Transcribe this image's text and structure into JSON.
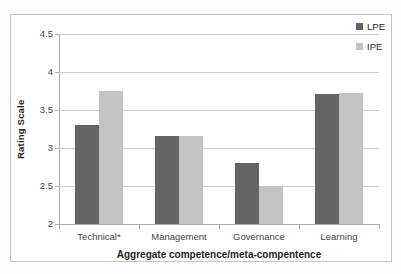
{
  "chart_data": {
    "type": "bar",
    "categories": [
      "Technical*",
      "Management",
      "Governance",
      "Learning"
    ],
    "series": [
      {
        "name": "LPE",
        "color": "#636363",
        "values": [
          3.3,
          3.16,
          2.8,
          3.71
        ]
      },
      {
        "name": "IPE",
        "color": "#c3c3c3",
        "values": [
          3.75,
          3.16,
          2.5,
          3.73
        ]
      }
    ],
    "title": "",
    "xlabel": "Aggregate competence/meta-compentence",
    "ylabel": "Rating Scale",
    "ylim": [
      2,
      4.5
    ],
    "yticks": [
      2,
      2.5,
      3,
      3.5,
      4,
      4.5
    ],
    "grid": true,
    "legend_position": "top-right",
    "colors": {
      "frame_border": "#c4c4c4",
      "gridline": "#cccccc",
      "axis_line": "#adadad",
      "tick_text": "#3f3f3f",
      "title_text": "#1f1f1f"
    }
  }
}
